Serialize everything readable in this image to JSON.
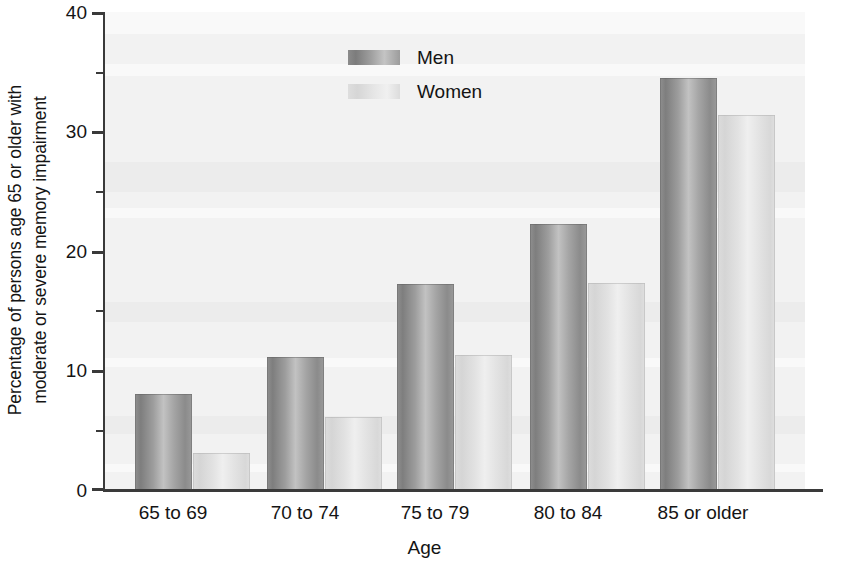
{
  "chart_data": {
    "type": "bar",
    "title": "",
    "xlabel": "Age",
    "ylabel_line1": "Percentage of persons age 65 or older with",
    "ylabel_line2": "moderate or severe memory impairment",
    "categories": [
      "65 to 69",
      "70 to 74",
      "75 to 79",
      "80 to 84",
      "85 or older"
    ],
    "series": [
      {
        "name": "Men",
        "values": [
          8.0,
          11.1,
          17.2,
          22.3,
          34.5
        ],
        "color": "#9a9a9a"
      },
      {
        "name": "Women",
        "values": [
          3.1,
          6.1,
          11.3,
          17.3,
          31.4
        ],
        "color": "#e0e0e0"
      }
    ],
    "ylim": [
      0,
      40
    ],
    "yticks": [
      0,
      10,
      20,
      30,
      40
    ],
    "yticks_minor": [
      5,
      15,
      25,
      35
    ],
    "grid": false,
    "legend_position": "top-left-inside",
    "plot_background": "#f2f2f2",
    "axis_color": "#3a3a3a"
  },
  "legend": {
    "entries": [
      {
        "label": "Men"
      },
      {
        "label": "Women"
      }
    ]
  }
}
